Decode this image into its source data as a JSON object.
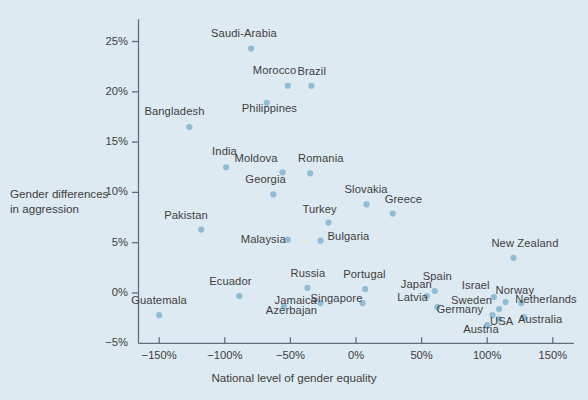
{
  "chart_data": {
    "type": "scatter",
    "title": "",
    "xlabel": "National level of gender equality",
    "ylabel_line1": "Gender differences",
    "ylabel_line2": "in aggression",
    "xlim": [
      -175,
      175
    ],
    "ylim": [
      -5,
      27
    ],
    "xticks": [
      -150,
      -100,
      -50,
      0,
      50,
      100,
      150
    ],
    "xticklabels": [
      "−150%",
      "−100%",
      "−50%",
      "0%",
      "50%",
      "100%",
      "150%"
    ],
    "yticks": [
      -5,
      0,
      5,
      10,
      15,
      20,
      25
    ],
    "yticklabels": [
      "−5%",
      "0%",
      "5%",
      "10%",
      "15%",
      "20%",
      "25%"
    ],
    "grid": false,
    "legend": null,
    "marker_color": "#8fbdd8",
    "axis_color": "#5d6f7c",
    "text_color": "#3d3d3d",
    "background_color": "#deeaf2",
    "points": [
      {
        "name": "Saudi-Arabia",
        "x": -80,
        "y": 24.3,
        "label_dx": -40,
        "label_dy": -15
      },
      {
        "name": "Morocco",
        "x": -52,
        "y": 20.6,
        "label_dx": -35,
        "label_dy": -15
      },
      {
        "name": "Brazil",
        "x": -34,
        "y": 20.6,
        "label_dx": -14,
        "label_dy": -14
      },
      {
        "name": "Philippines",
        "x": -68,
        "y": 18.9,
        "label_dx": -25,
        "label_dy": 6
      },
      {
        "name": "Bangladesh",
        "x": -127,
        "y": 16.5,
        "label_dx": -45,
        "label_dy": -15
      },
      {
        "name": "India",
        "x": -99,
        "y": 12.5,
        "label_dx": -14,
        "label_dy": -15
      },
      {
        "name": "Moldova",
        "x": -56,
        "y": 12.0,
        "label_dx": -48,
        "label_dy": -13
      },
      {
        "name": "Romania",
        "x": -35,
        "y": 11.9,
        "label_dx": -12,
        "label_dy": -14
      },
      {
        "name": "Georgia",
        "x": -63,
        "y": 9.8,
        "label_dx": -28,
        "label_dy": -14
      },
      {
        "name": "Slovakia",
        "x": 8,
        "y": 8.8,
        "label_dx": -22,
        "label_dy": -14
      },
      {
        "name": "Greece",
        "x": 28,
        "y": 7.9,
        "label_dx": -8,
        "label_dy": -14
      },
      {
        "name": "Turkey",
        "x": -21,
        "y": 7.0,
        "label_dx": -26,
        "label_dy": -13
      },
      {
        "name": "Pakistan",
        "x": -118,
        "y": 6.3,
        "label_dx": -37,
        "label_dy": -14
      },
      {
        "name": "Malaysia",
        "x": -52,
        "y": 5.3,
        "label_dx": -47,
        "label_dy": 0
      },
      {
        "name": "Bulgaria",
        "x": -27,
        "y": 5.2,
        "label_dx": 7,
        "label_dy": -4
      },
      {
        "name": "New Zealand",
        "x": 120,
        "y": 3.5,
        "label_dx": -22,
        "label_dy": -14
      },
      {
        "name": "Russia",
        "x": -37,
        "y": 0.5,
        "label_dx": -17,
        "label_dy": -14
      },
      {
        "name": "Portugal",
        "x": 7,
        "y": 0.4,
        "label_dx": -22,
        "label_dy": -14
      },
      {
        "name": "Spain",
        "x": 60,
        "y": 0.2,
        "label_dx": -12,
        "label_dy": -14
      },
      {
        "name": "Japan",
        "x": 54,
        "y": -0.3,
        "label_dx": -26,
        "label_dy": -11
      },
      {
        "name": "Ecuador",
        "x": -89,
        "y": -0.3,
        "label_dx": -30,
        "label_dy": -14
      },
      {
        "name": "Singapore",
        "x": 5,
        "y": -1.0,
        "label_dx": -52,
        "label_dy": -4
      },
      {
        "name": "Israel",
        "x": 105,
        "y": -0.4,
        "label_dx": -32,
        "label_dy": -11
      },
      {
        "name": "Norway",
        "x": 114,
        "y": -0.9,
        "label_dx": -10,
        "label_dy": -11
      },
      {
        "name": "Jamaica",
        "x": -27,
        "y": -1.0,
        "label_dx": -46,
        "label_dy": -2
      },
      {
        "name": "Netherlands",
        "x": 126,
        "y": -1.0,
        "label_dx": -6,
        "label_dy": -3
      },
      {
        "name": "Latvia",
        "x": 62,
        "y": -1.4,
        "label_dx": -40,
        "label_dy": -9
      },
      {
        "name": "Sweden",
        "x": 109,
        "y": -1.6,
        "label_dx": -48,
        "label_dy": -8
      },
      {
        "name": "Azerbajan",
        "x": -55,
        "y": -1.3,
        "label_dx": -18,
        "label_dy": 5
      },
      {
        "name": "Germany",
        "x": 104,
        "y": -2.2,
        "label_dx": -56,
        "label_dy": -5
      },
      {
        "name": "USA",
        "x": 109,
        "y": -2.6,
        "label_dx": -9,
        "label_dy": 3
      },
      {
        "name": "Australia",
        "x": 128,
        "y": -2.4,
        "label_dx": -6,
        "label_dy": 3
      },
      {
        "name": "Guatemala",
        "x": -150,
        "y": -2.2,
        "label_dx": -28,
        "label_dy": -14
      },
      {
        "name": "Austria",
        "x": 100,
        "y": -3.2,
        "label_dx": -24,
        "label_dy": 5
      }
    ]
  }
}
